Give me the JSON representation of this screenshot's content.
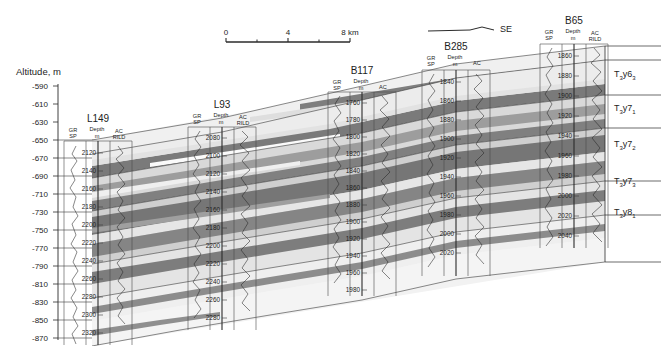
{
  "figure": {
    "type": "geological-well-log-cross-section",
    "axis": {
      "title": "Altitude, m",
      "ticks": [
        "-590",
        "-610",
        "-630",
        "-650",
        "-670",
        "-690",
        "-710",
        "-730",
        "-750",
        "-770",
        "-790",
        "-810",
        "-830",
        "-850",
        "-870"
      ],
      "min": -870,
      "max": -590,
      "step": 20
    },
    "scalebar": {
      "labels": [
        "0",
        "4",
        "8 km"
      ],
      "unit": "km",
      "ticks": 4,
      "length_km": 8
    },
    "direction_legend": {
      "label": "SE",
      "symbol": "correlation-line"
    },
    "track_labels": {
      "left_top": "GR",
      "left_bottom": "SP",
      "center_top": "Depth",
      "center_bottom": "m",
      "right_top": "AC",
      "right_bottom": "RILD",
      "right_top_short": "AC"
    },
    "wells": [
      {
        "name": "L149",
        "x": 98,
        "header_y": 118,
        "top_y": 146,
        "bottom_y": 345,
        "curves": [
          "GR",
          "SP",
          "AC",
          "RILD"
        ],
        "depths": [
          "2120",
          "2140",
          "2160",
          "2180",
          "2200",
          "2220",
          "2240",
          "2260",
          "2280",
          "2300",
          "2320"
        ],
        "depth_top": 2120,
        "depth_step": 20
      },
      {
        "name": "L93",
        "x": 222,
        "header_y": 104,
        "top_y": 131,
        "bottom_y": 330,
        "curves": [
          "GR",
          "SP",
          "AC",
          "RILD"
        ],
        "depths": [
          "2080",
          "2100",
          "2120",
          "2140",
          "2160",
          "2180",
          "2200",
          "2220",
          "2240",
          "2260",
          "2280"
        ],
        "depth_top": 2080,
        "depth_step": 20
      },
      {
        "name": "B117",
        "x": 362,
        "header_y": 70,
        "top_y": 96,
        "bottom_y": 296,
        "curves": [
          "GR",
          "SP",
          "AC"
        ],
        "depths": [
          "1760",
          "1780",
          "1800",
          "1820",
          "1840",
          "1860",
          "1880",
          "1900",
          "1920",
          "1940",
          "1960",
          "1980"
        ],
        "depth_top": 1760,
        "depth_step": 20
      },
      {
        "name": "B285",
        "x": 456,
        "header_y": 46,
        "top_y": 76,
        "bottom_y": 276,
        "curves": [
          "GR",
          "SP",
          "AC"
        ],
        "depths": [
          "1840",
          "1860",
          "1880",
          "1900",
          "1920",
          "1940",
          "1960",
          "1980",
          "2000",
          "2020"
        ],
        "depth_top": 1840,
        "depth_step": 20
      },
      {
        "name": "B65",
        "x": 574,
        "header_y": 20,
        "top_y": 48,
        "bottom_y": 248,
        "curves": [
          "GR",
          "SP",
          "AC",
          "RILD"
        ],
        "depths": [
          "1860",
          "1880",
          "1900",
          "1920",
          "1940",
          "1960",
          "1980",
          "2000",
          "2020",
          "2040"
        ],
        "depth_top": 1860,
        "depth_step": 20
      }
    ],
    "strat_units": [
      {
        "label": "T",
        "sub1": "3",
        "mid": "y6",
        "sub2": "3",
        "y": 74
      },
      {
        "label": "T",
        "sub1": "3",
        "mid": "y7",
        "sub2": "1",
        "y": 108
      },
      {
        "label": "T",
        "sub1": "3",
        "mid": "y7",
        "sub2": "2",
        "y": 144
      },
      {
        "label": "T",
        "sub1": "3",
        "mid": "y7",
        "sub2": "3",
        "y": 181
      },
      {
        "label": "T",
        "sub1": "3",
        "mid": "y8",
        "sub2": "1",
        "y": 212
      }
    ],
    "colors": {
      "sand_dark": "#7c7c7c",
      "sand_mid": "#9a9a9a",
      "shale_light": "#d5d5d5",
      "shale_pale": "#e8e8e8",
      "background": "#ffffff",
      "line": "#2b2b2b",
      "text": "#1d1d1d"
    }
  }
}
